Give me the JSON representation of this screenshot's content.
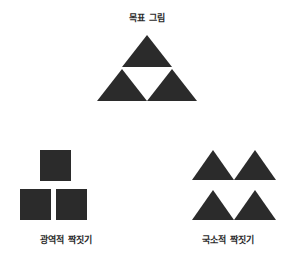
{
  "figure": {
    "background_color": "#ffffff",
    "ink_color": "#2b2b2b",
    "target_title": "목표 그림",
    "global_caption": "광역적 짝짓기",
    "local_caption": "국소적 짝짓기"
  },
  "panels": {
    "target": {
      "name": "target-figure",
      "title": "목표 그림",
      "shape_kind": "triangle",
      "shape_count": 3,
      "arrangement": "triforce: one apex triangle above two base triangles",
      "shapes": [
        {
          "id": "apex",
          "type": "triangle",
          "half_width": 25,
          "height": 32,
          "left": 25,
          "top": 2
        },
        {
          "id": "base-left",
          "type": "triangle",
          "half_width": 25,
          "height": 32,
          "left": 0,
          "top": 36
        },
        {
          "id": "base-right",
          "type": "triangle",
          "half_width": 25,
          "height": 32,
          "left": 50,
          "top": 36
        }
      ]
    },
    "global": {
      "name": "global-matching",
      "caption": "광역적 짝짓기",
      "shape_kind": "square",
      "shape_count": 3,
      "arrangement": "one square above two squares, same overall triangular layout",
      "shapes": [
        {
          "id": "top",
          "type": "square",
          "size": 31,
          "left": 20,
          "top": 0
        },
        {
          "id": "bottom-left",
          "type": "square",
          "size": 31,
          "left": 0,
          "top": 39
        },
        {
          "id": "bottom-right",
          "type": "square",
          "size": 31,
          "left": 36,
          "top": 39
        }
      ]
    },
    "local": {
      "name": "local-matching",
      "caption": "국소적 짝짓기",
      "shape_kind": "triangle",
      "shape_count": 4,
      "arrangement": "2 by 2 grid of triangles, same local element as target",
      "shapes": [
        {
          "id": "row1-col1",
          "type": "triangle",
          "half_width": 21,
          "height": 30,
          "left": 0,
          "top": 0
        },
        {
          "id": "row1-col2",
          "type": "triangle",
          "half_width": 21,
          "height": 30,
          "left": 42,
          "top": 0
        },
        {
          "id": "row2-col1",
          "type": "triangle",
          "half_width": 21,
          "height": 30,
          "left": 0,
          "top": 40
        },
        {
          "id": "row2-col2",
          "type": "triangle",
          "half_width": 21,
          "height": 30,
          "left": 42,
          "top": 40
        }
      ]
    }
  }
}
